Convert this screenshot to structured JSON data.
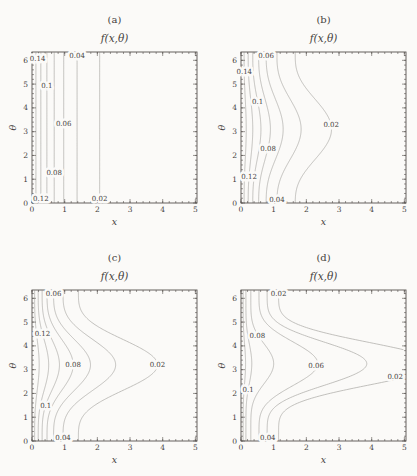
{
  "figure": {
    "background": "#fbfaf8",
    "axis_color": "#55514e",
    "text_color": "#45413d",
    "contour_color": "#b3b1ad",
    "label_halo": "#fbfaf8"
  },
  "chart_data": [
    {
      "id": "a",
      "type": "contour",
      "caption": "(a)",
      "title": "f(x,θ)",
      "xlabel": "x",
      "ylabel": "θ",
      "xlim": [
        0,
        5.05
      ],
      "ylim": [
        0,
        6.35
      ],
      "xticks": [
        0,
        1,
        2,
        3,
        4,
        5
      ],
      "yticks": [
        0,
        1,
        2,
        3,
        4,
        5,
        6
      ],
      "minor_step": 0.2,
      "theta0": 3.14,
      "contours": [
        {
          "level": 0.02,
          "base": 2.07,
          "peak": 2.07,
          "p": 1
        },
        {
          "level": 0.04,
          "base": 1.38,
          "peak": 1.38,
          "p": 1
        },
        {
          "level": 0.06,
          "base": 0.97,
          "peak": 0.97,
          "p": 1
        },
        {
          "level": 0.08,
          "base": 0.68,
          "peak": 0.68,
          "p": 1
        },
        {
          "level": 0.1,
          "base": 0.455,
          "peak": 0.455,
          "p": 1
        },
        {
          "level": 0.12,
          "base": 0.27,
          "peak": 0.27,
          "p": 1
        },
        {
          "level": 0.14,
          "base": 0.12,
          "peak": 0.12,
          "p": 1
        }
      ],
      "labels": [
        {
          "t": "0.14",
          "x": 0.17,
          "th": 6.08
        },
        {
          "t": "0.04",
          "x": 1.38,
          "th": 6.17
        },
        {
          "t": "0.1",
          "x": 0.455,
          "th": 4.92
        },
        {
          "t": "0.06",
          "x": 0.97,
          "th": 3.35
        },
        {
          "t": "0.08",
          "x": 0.68,
          "th": 1.28
        },
        {
          "t": "0.12",
          "x": 0.27,
          "th": 0.17
        },
        {
          "t": "0.02",
          "x": 2.07,
          "th": 0.17
        }
      ]
    },
    {
      "id": "b",
      "type": "contour",
      "caption": "(b)",
      "title": "f(x,θ)",
      "xlabel": "x",
      "ylabel": "θ",
      "xlim": [
        0,
        5.05
      ],
      "ylim": [
        0,
        6.35
      ],
      "xticks": [
        0,
        1,
        2,
        3,
        4,
        5
      ],
      "yticks": [
        0,
        1,
        2,
        3,
        4,
        5,
        6
      ],
      "minor_step": 0.2,
      "theta0": 3.1,
      "contours": [
        {
          "level": 0.02,
          "base": 1.66,
          "peak": 2.77,
          "p": 1.4
        },
        {
          "level": 0.04,
          "base": 1.1,
          "peak": 1.84,
          "p": 1.4
        },
        {
          "level": 0.06,
          "base": 0.77,
          "peak": 1.29,
          "p": 1.4
        },
        {
          "level": 0.08,
          "base": 0.54,
          "peak": 0.9,
          "p": 1.4
        },
        {
          "level": 0.1,
          "base": 0.36,
          "peak": 0.61,
          "p": 1.4
        },
        {
          "level": 0.12,
          "base": 0.22,
          "peak": 0.36,
          "p": 1.4
        },
        {
          "level": 0.14,
          "base": 0.095,
          "peak": 0.16,
          "p": 1.4
        }
      ],
      "labels": [
        {
          "t": "0.06",
          "x": 0.77,
          "th": 6.17
        },
        {
          "t": "0.14",
          "x": 0.1,
          "th": 5.5
        },
        {
          "t": "0.1",
          "x": 0.51,
          "th": 4.25
        },
        {
          "t": "0.02",
          "x": 2.76,
          "th": 3.3
        },
        {
          "t": "0.08",
          "x": 0.83,
          "th": 2.3
        },
        {
          "t": "0.12",
          "x": 0.25,
          "th": 1.1
        },
        {
          "t": "0.04",
          "x": 1.1,
          "th": 0.15
        }
      ]
    },
    {
      "id": "c",
      "type": "contour",
      "caption": "(c)",
      "title": "f(x,θ)",
      "xlabel": "x",
      "ylabel": "θ",
      "xlim": [
        0,
        5.05
      ],
      "ylim": [
        0,
        6.35
      ],
      "xticks": [
        0,
        1,
        2,
        3,
        4,
        5
      ],
      "yticks": [
        0,
        1,
        2,
        3,
        4,
        5,
        6
      ],
      "minor_step": 0.2,
      "theta0": 3.2,
      "contours": [
        {
          "level": 0.02,
          "base": 1.42,
          "peak": 3.84,
          "p": 1.9
        },
        {
          "level": 0.04,
          "base": 0.95,
          "peak": 2.56,
          "p": 1.9
        },
        {
          "level": 0.06,
          "base": 0.66,
          "peak": 1.79,
          "p": 1.9
        },
        {
          "level": 0.08,
          "base": 0.46,
          "peak": 1.26,
          "p": 1.9
        },
        {
          "level": 0.1,
          "base": 0.31,
          "peak": 0.84,
          "p": 1.9
        },
        {
          "level": 0.12,
          "base": 0.19,
          "peak": 0.51,
          "p": 1.9
        },
        {
          "level": 0.14,
          "base": 0.08,
          "peak": 0.22,
          "p": 1.9
        }
      ],
      "labels": [
        {
          "t": "0.06",
          "x": 0.66,
          "th": 6.2
        },
        {
          "t": "0.12",
          "x": 0.32,
          "th": 4.5
        },
        {
          "t": "0.08",
          "x": 1.26,
          "th": 3.2
        },
        {
          "t": "0.02",
          "x": 3.84,
          "th": 3.2
        },
        {
          "t": "0.1",
          "x": 0.42,
          "th": 1.5
        },
        {
          "t": "0.04",
          "x": 0.95,
          "th": 0.12
        }
      ]
    },
    {
      "id": "d",
      "type": "contour",
      "caption": "(d)",
      "title": "f(x,θ)",
      "xlabel": "x",
      "ylabel": "θ",
      "xlim": [
        0,
        5.05
      ],
      "ylim": [
        0,
        6.35
      ],
      "xticks": [
        0,
        1,
        2,
        3,
        4,
        5
      ],
      "yticks": [
        0,
        1,
        2,
        3,
        4,
        5,
        6
      ],
      "minor_step": 0.2,
      "theta0": 3.25,
      "contours": [
        {
          "level": 0.02,
          "base": 1.15,
          "peak": 6.0,
          "p": 2.7
        },
        {
          "level": 0.04,
          "base": 0.8,
          "peak": 3.85,
          "p": 2.6
        },
        {
          "level": 0.06,
          "base": 0.55,
          "peak": 2.35,
          "p": 2.5
        },
        {
          "level": 0.08,
          "base": 0.3,
          "peak": 1.0,
          "p": 3
        },
        {
          "level": 0.1,
          "base": 0.15,
          "peak": 0.33,
          "p": 3
        },
        {
          "level": 0.12,
          "base": 0.065,
          "peak": 0.14,
          "p": 3
        }
      ],
      "labels": [
        {
          "t": "0.02",
          "x": 1.15,
          "th": 6.17
        },
        {
          "t": "0.08",
          "x": 0.5,
          "th": 4.42
        },
        {
          "t": "0.06",
          "x": 2.3,
          "th": 3.18
        },
        {
          "t": "0.1",
          "x": 0.22,
          "th": 2.15
        },
        {
          "t": "0.02",
          "x": 4.72,
          "th": 2.72
        },
        {
          "t": "0.04",
          "x": 0.82,
          "th": 0.15
        }
      ]
    }
  ]
}
